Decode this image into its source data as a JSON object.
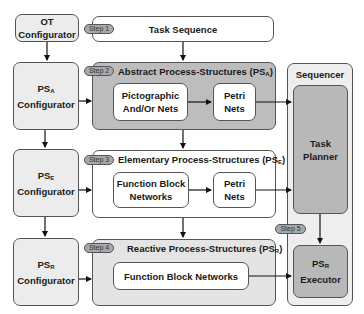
{
  "configurators": {
    "ot": {
      "line1": "OT",
      "line2": "Configurator"
    },
    "ps_a": {
      "base": "PS",
      "sub": "A",
      "line2": "Configurator"
    },
    "ps_e": {
      "base": "PS",
      "sub": "E",
      "line2": "Configurator"
    },
    "ps_r": {
      "base": "PS",
      "sub": "R",
      "line2": "Configurator"
    }
  },
  "steps": {
    "step1": "Step 1",
    "step2": "Step 2",
    "step3": "Step 3",
    "step4": "Step 4",
    "step5": "Step 5"
  },
  "task_sequence": {
    "title": "Task Sequence"
  },
  "abstract": {
    "title": "Abstract Process-Structures (PS",
    "title_sub": "A",
    "title_end": ")",
    "pictographic": {
      "line1": "Pictographic",
      "line2": "And/Or Nets"
    },
    "petri": {
      "line1": "Petri",
      "line2": "Nets"
    }
  },
  "elementary": {
    "title": "Elementary Process-Structures (PS",
    "title_sub": "E",
    "title_end": ")",
    "fbn": {
      "line1": "Function Block",
      "line2": "Networks"
    },
    "petri": {
      "line1": "Petri",
      "line2": "Nets"
    }
  },
  "reactive": {
    "title": "Reactive Process-Structures (PS",
    "title_sub": "R",
    "title_end": ")",
    "fbn": {
      "label": "Function Block Networks"
    }
  },
  "sequencer": {
    "title": "Sequencer",
    "task_planner": {
      "line1": "Task",
      "line2": "Planner"
    },
    "executor": {
      "base": "PS",
      "sub": "R",
      "line2": "Executor"
    }
  },
  "colors": {
    "abstract_bg": "#bdbdbd",
    "elementary_bg": "#ffffff",
    "reactive_bg": "#e4e4e4",
    "sequencer_bg": "#eeeeee",
    "planner_bg": "#b8b8b8",
    "configurator_bg": "#ececec",
    "step_pill": "#a8a8a8"
  }
}
